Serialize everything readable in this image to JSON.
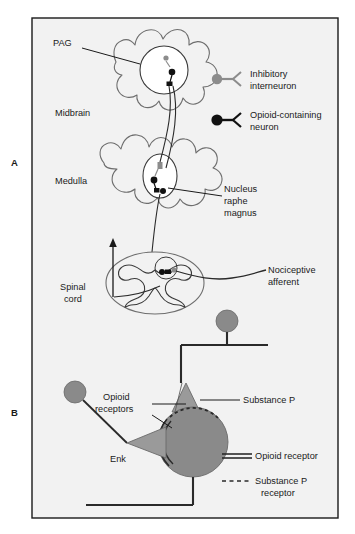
{
  "figure": {
    "panels": [
      {
        "letter": "A"
      },
      {
        "letter": "B"
      }
    ]
  },
  "panel_a": {
    "labels": {
      "pag": "PAG",
      "midbrain": "Midbrain",
      "medulla": "Medulla",
      "nucleus_raphe_magnus": "Nucleus\nraphe\nmagnus",
      "nucleus_raphe_magnus_l1": "Nucleus",
      "nucleus_raphe_magnus_l2": "raphe",
      "nucleus_raphe_magnus_l3": "magnus",
      "spinal_cord_l1": "Spinal",
      "spinal_cord_l2": "cord",
      "nociceptive_afferent_l1": "Nociceptive",
      "nociceptive_afferent_l2": "afferent"
    },
    "legend": [
      {
        "marker": "gray-circle-neuron-icon",
        "line1": "Inhibitory",
        "line2": "interneuron",
        "color": "#8c8c8c"
      },
      {
        "marker": "black-circle-neuron-icon",
        "line1": "Opioid-containing",
        "line2": "neuron",
        "color": "#111111"
      }
    ]
  },
  "panel_b": {
    "labels": {
      "opioid_receptors_l1": "Opioid",
      "opioid_receptors_l2": "receptors",
      "substance_p": "Substance P",
      "enk": "Enk"
    },
    "legend": [
      {
        "marker": "double-solid-line-icon",
        "text": "Opioid receptor",
        "style": "solid"
      },
      {
        "marker": "dashed-line-icon",
        "line1": "Substance P",
        "line2": "receptor",
        "style": "dashed"
      }
    ]
  },
  "colors": {
    "frame_border": "#1a1a1a",
    "frame_background": "#f2f2f2",
    "page_background": "#ffffff",
    "gray_neuron": "#8c8c8c",
    "black_neuron": "#111111",
    "cell_body": "#8a8a8a",
    "terminal_triangle": "#9a9a9a",
    "outline": "#3a3a3a",
    "tissue_outline": "#6e6e6e",
    "text": "#1a1a1a"
  }
}
